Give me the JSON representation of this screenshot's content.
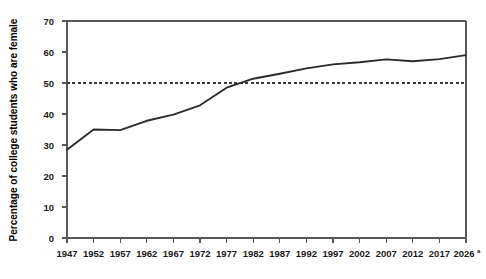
{
  "chart_data": {
    "type": "line",
    "title": "",
    "subtitle": "",
    "xlabel": "",
    "ylabel": "Percentage of college students who are female",
    "xlim": [
      1947,
      2026
    ],
    "ylim": [
      0,
      70
    ],
    "yticks": [
      0,
      10,
      20,
      30,
      40,
      50,
      60,
      70
    ],
    "ytick_labels": [
      "0",
      "10",
      "20",
      "30",
      "40",
      "50",
      "60",
      "70"
    ],
    "xticks": [
      1947,
      1952,
      1957,
      1962,
      1967,
      1972,
      1977,
      1982,
      1987,
      1992,
      1997,
      2002,
      2007,
      2012,
      2017,
      2026
    ],
    "xtick_labels": [
      "1947",
      "1952",
      "1957",
      "1962",
      "1967",
      "1972",
      "1977",
      "1982",
      "1987",
      "1992",
      "1997",
      "2002",
      "2007",
      "2012",
      "2017",
      "2026"
    ],
    "xtick_superscripts": [
      "",
      "",
      "",
      "",
      "",
      "",
      "",
      "",
      "",
      "",
      "",
      "",
      "",
      "",
      "",
      "a"
    ],
    "grid": false,
    "legend": false,
    "legend_position": "none",
    "x": [
      1947,
      1952,
      1957,
      1962,
      1967,
      1972,
      1977,
      1982,
      1987,
      1992,
      1997,
      2002,
      2007,
      2012,
      2017,
      2026
    ],
    "values": [
      28.5,
      35.0,
      34.8,
      37.8,
      39.8,
      42.8,
      48.5,
      51.4,
      53.0,
      54.7,
      56.0,
      56.7,
      57.6,
      57.0,
      57.7,
      59.0
    ],
    "series": [
      {
        "name": "Percentage of college students who are female",
        "values": [
          28.5,
          35.0,
          34.8,
          37.8,
          39.8,
          42.8,
          48.5,
          51.4,
          53.0,
          54.7,
          56.0,
          56.7,
          57.6,
          57.0,
          57.7,
          59.0
        ],
        "color": "#2b2b2b"
      }
    ],
    "reference_lines": [
      {
        "name": "fifty-percent-reference",
        "axis": "y",
        "value": 50,
        "style": "dashed",
        "color": "#3a3a3a"
      }
    ],
    "annotations": []
  },
  "axis": {
    "y_title": "Percentage of college students who are female"
  }
}
